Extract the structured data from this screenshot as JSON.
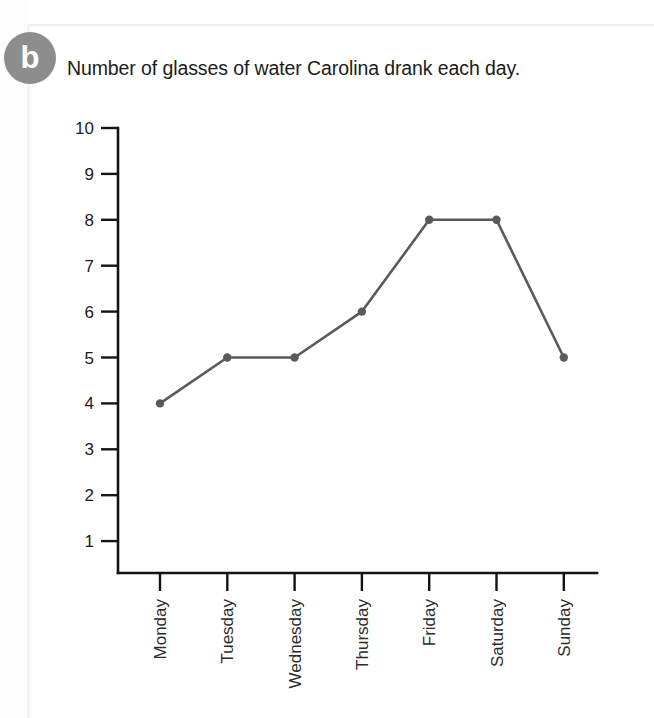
{
  "worksheet": {
    "question_label": "b"
  },
  "chart_data": {
    "type": "line",
    "title": "Number of glasses of water Carolina drank each day.",
    "xlabel": "",
    "ylabel": "",
    "categories": [
      "Monday",
      "Tuesday",
      "Wednesday",
      "Thursday",
      "Friday",
      "Saturday",
      "Sunday"
    ],
    "values": [
      4,
      5,
      5,
      6,
      8,
      8,
      5
    ],
    "ytick_labels": [
      "10",
      "9",
      "8",
      "7",
      "6",
      "5",
      "4",
      "3",
      "2",
      "1"
    ],
    "ytick_values": [
      10,
      9,
      8,
      7,
      6,
      5,
      4,
      3,
      2,
      1
    ],
    "ylim": [
      0.3,
      10
    ],
    "grid": false,
    "legend": false,
    "marker": "circle",
    "series_color": "#5a5a5a",
    "axis_color": "#141414",
    "xtick_label_rotation": -90
  }
}
